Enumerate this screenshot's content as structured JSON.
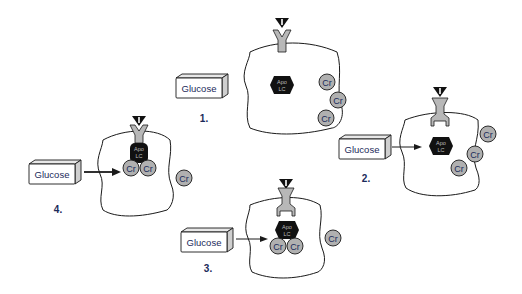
{
  "diagram": {
    "colors": {
      "outline": "#1a1a1a",
      "receptor_fill": "#b8b8b8",
      "cr_fill": "#b0b0b0",
      "apolc_fill": "#111111",
      "insulin": "#111111",
      "glucose_text": "#1a2a5a",
      "step_text": "#1a2a5a"
    },
    "panels": [
      {
        "step": "1.",
        "glucose_label": "Glucose",
        "apo_top": "Apo",
        "apo_bottom": "LC",
        "cr_labels": [
          "Cr",
          "Cr",
          "Cr"
        ],
        "description": "Insulin binds receptor; chromium outside cell"
      },
      {
        "step": "2.",
        "glucose_label": "Glucose",
        "apo_top": "Apo",
        "apo_bottom": "LC",
        "cr_labels": [
          "Cr",
          "Cr",
          "Cr"
        ],
        "description": "Receptor activated; chromium moves into cell"
      },
      {
        "step": "3.",
        "glucose_label": "Glucose",
        "apo_top": "Apo",
        "apo_bottom": "LC",
        "cr_labels": [
          "Cr",
          "Cr",
          "Cr"
        ],
        "description": "Chromium binds ApoLMWCr"
      },
      {
        "step": "4.",
        "glucose_label": "Glucose",
        "apo_top": "Apo",
        "apo_bottom": "LC",
        "cr_labels": [
          "Cr",
          "Cr",
          "Cr"
        ],
        "description": "Holo-chromodulin binds receptor, amplifying signal"
      }
    ]
  }
}
